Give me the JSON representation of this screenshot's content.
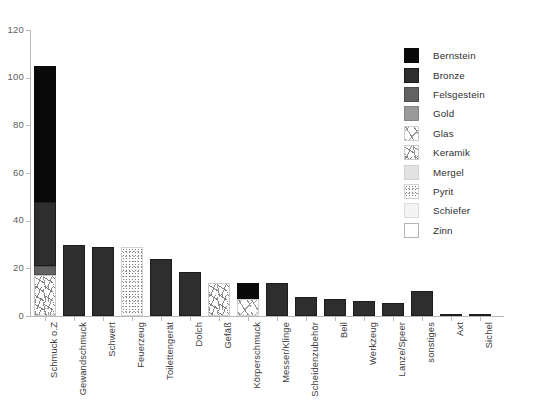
{
  "chart_data": {
    "type": "bar",
    "stacked": true,
    "title": "",
    "subtitle": "",
    "xlabel": "",
    "ylabel": "",
    "ylim": [
      0,
      120
    ],
    "yticks": [
      0,
      20,
      40,
      60,
      80,
      100,
      120
    ],
    "ytick_labels": [
      "0",
      "20",
      "40",
      "60",
      "80",
      "100",
      "120"
    ],
    "grid": false,
    "legend_position": "right",
    "categories": [
      "Schmuck o.Z",
      "Gewandschmuck",
      "Schwert",
      "Feuerzeug",
      "Toilettengerät",
      "Dolch",
      "Gefäß",
      "Körperschmuck",
      "Messer/Klinge",
      "Scheidenzubehör",
      "Beil",
      "Werkzeug",
      "Lanze/Speer",
      "sonstiges",
      "Axt",
      "Sichel"
    ],
    "series": [
      {
        "name": "Bernstein",
        "color": "#0a0a0a",
        "values": [
          57,
          0,
          0,
          0,
          0,
          0,
          0,
          7,
          0,
          0,
          0,
          0,
          0,
          0,
          0,
          0
        ]
      },
      {
        "name": "Bronze",
        "color": "#2e2e2e",
        "values": [
          27,
          30,
          29,
          0,
          24,
          18.5,
          0,
          0,
          14,
          8,
          7,
          6.5,
          5.5,
          10.5,
          1,
          1
        ]
      },
      {
        "name": "Felsgestein",
        "color": "#626262",
        "values": [
          4,
          0,
          0,
          0,
          0,
          0,
          0,
          0,
          0,
          0,
          0,
          0,
          0,
          0,
          0,
          0
        ]
      },
      {
        "name": "Gold",
        "color": "#9a9a9a",
        "values": [
          0,
          0,
          0,
          0,
          0,
          0,
          0,
          0,
          0,
          0,
          0,
          0,
          0,
          0,
          0,
          0
        ]
      },
      {
        "name": "Glas",
        "color": "#ffffff",
        "values": [
          0,
          0,
          0,
          0,
          0,
          0,
          0,
          7,
          0,
          0,
          0,
          0,
          0,
          0,
          0,
          0
        ]
      },
      {
        "name": "Keramik",
        "color": "#ffffff",
        "values": [
          17,
          0,
          0,
          0,
          0,
          0,
          14,
          0,
          0,
          0,
          0,
          0,
          0,
          0,
          0,
          0
        ]
      },
      {
        "name": "Mergel",
        "color": "#e2e2e2",
        "values": [
          0,
          0,
          0,
          0,
          0,
          0,
          0,
          0,
          0,
          0,
          0,
          0,
          0,
          0,
          0,
          0
        ]
      },
      {
        "name": "Pyrit",
        "color": "#fdfdfd",
        "values": [
          0,
          0,
          0,
          29,
          0,
          0,
          0,
          0,
          0,
          0,
          0,
          0,
          0,
          0,
          0,
          0
        ]
      },
      {
        "name": "Schiefer",
        "color": "#f4f4f4",
        "values": [
          0,
          0,
          0,
          0,
          0,
          0,
          0,
          0,
          0,
          0,
          0,
          0,
          0,
          0,
          0,
          0
        ]
      },
      {
        "name": "Zinn",
        "color": "#ffffff",
        "values": [
          0,
          0,
          0,
          0,
          0,
          0,
          0,
          0,
          0,
          0,
          0,
          0,
          0,
          0,
          0,
          0
        ]
      }
    ],
    "totals": [
      105,
      30,
      29,
      29,
      24,
      18.5,
      14,
      14,
      14,
      8,
      7,
      6.5,
      5.5,
      10.5,
      1,
      1
    ]
  },
  "legend": {
    "items": [
      {
        "label": "Bernstein",
        "swatch": "bernstein-swatch"
      },
      {
        "label": "Bronze",
        "swatch": "bronze-swatch"
      },
      {
        "label": "Felsgestein",
        "swatch": "felsgestein-swatch"
      },
      {
        "label": "Gold",
        "swatch": "gold-swatch"
      },
      {
        "label": "Glas",
        "swatch": "glas-swatch"
      },
      {
        "label": "Keramik",
        "swatch": "keramik-swatch"
      },
      {
        "label": "Mergel",
        "swatch": "mergel-swatch"
      },
      {
        "label": "Pyrit",
        "swatch": "pyrit-swatch"
      },
      {
        "label": "Schiefer",
        "swatch": "schiefer-swatch"
      },
      {
        "label": "Zinn",
        "swatch": "zinn-swatch"
      }
    ]
  }
}
